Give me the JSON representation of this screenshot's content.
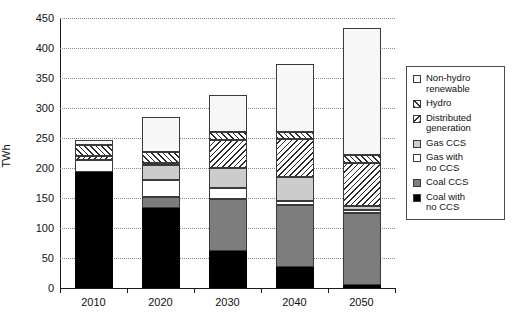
{
  "chart_data": {
    "type": "bar",
    "stacked": true,
    "title": "",
    "xlabel": "",
    "ylabel": "TWh",
    "categories": [
      "2010",
      "2020",
      "2030",
      "2040",
      "2050"
    ],
    "ylim": [
      0,
      450
    ],
    "yticks": [
      0,
      50,
      100,
      150,
      200,
      250,
      300,
      350,
      400,
      450
    ],
    "grid": true,
    "legend_position": "right",
    "stack_order_bottom_to_top": [
      "Coal with no CCS",
      "Coal CCS",
      "Gas with no CCS",
      "Gas CCS",
      "Distributed generation",
      "Hydro",
      "Non-hydro renewable"
    ],
    "series": [
      {
        "name": "Coal with no CCS",
        "swatch": "black",
        "values": [
          193,
          133,
          62,
          35,
          5
        ]
      },
      {
        "name": "Coal CCS",
        "swatch": "dark-gray",
        "values": [
          0,
          19,
          86,
          104,
          120
        ]
      },
      {
        "name": "Gas with no CCS",
        "swatch": "white",
        "values": [
          20,
          28,
          19,
          6,
          5
        ]
      },
      {
        "name": "Gas CCS",
        "swatch": "light-gray",
        "values": [
          0,
          25,
          33,
          40,
          6
        ]
      },
      {
        "name": "Distributed generation",
        "swatch": "back-hatch",
        "values": [
          7,
          4,
          46,
          63,
          72
        ]
      },
      {
        "name": "Hydro",
        "swatch": "forward-hatch",
        "values": [
          18,
          18,
          14,
          12,
          14
        ]
      },
      {
        "name": "Non-hydro renewable",
        "swatch": "off-white",
        "values": [
          8,
          58,
          62,
          114,
          211
        ]
      }
    ],
    "totals": [
      246,
      285,
      322,
      374,
      433
    ]
  },
  "axis": {
    "y_title": "TWh",
    "y_tick_labels": [
      "0",
      "50",
      "100",
      "150",
      "200",
      "250",
      "300",
      "350",
      "400",
      "450"
    ],
    "x_tick_labels": [
      "2010",
      "2020",
      "2030",
      "2040",
      "2050"
    ]
  },
  "legend": {
    "items": [
      {
        "label": "Non-hydro\nrenewable",
        "line1": "Non-hydro",
        "line2": "renewable",
        "swatch": "off-white"
      },
      {
        "label": "Hydro",
        "line1": "Hydro",
        "line2": "",
        "swatch": "forward-hatch"
      },
      {
        "label": "Distributed\ngeneration",
        "line1": "Distributed",
        "line2": "generation",
        "swatch": "back-hatch"
      },
      {
        "label": "Gas CCS",
        "line1": "Gas CCS",
        "line2": "",
        "swatch": "light-gray"
      },
      {
        "label": "Gas with\nno CCS",
        "line1": "Gas with",
        "line2": "no CCS",
        "swatch": "white"
      },
      {
        "label": "Coal CCS",
        "line1": "Coal CCS",
        "line2": "",
        "swatch": "dark-gray"
      },
      {
        "label": "Coal with\nno CCS",
        "line1": "Coal with",
        "line2": "no CCS",
        "swatch": "black"
      }
    ]
  },
  "colors": {
    "coal_no_ccs": "#000000",
    "coal_ccs": "#7d7d7d",
    "gas_no_ccs": "#ffffff",
    "gas_ccs": "#cccccc",
    "non_hydro": "#f7f7f7",
    "axis": "#1a1a1a",
    "grid": "#8a8a8a"
  }
}
